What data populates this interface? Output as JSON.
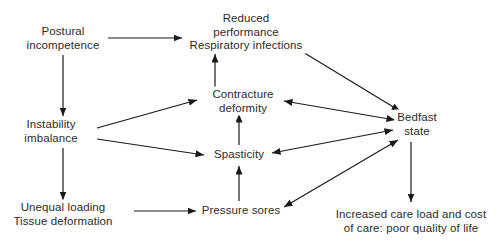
{
  "diagram": {
    "background_color": "#ffffff",
    "text_color": "#2b2b2b",
    "arrow_color": "#1a1a1a",
    "nodes": [
      {
        "id": "postural",
        "name": "postural-incompetence",
        "lines": [
          "Postural",
          "incompetence"
        ],
        "x": 63,
        "y": 38
      },
      {
        "id": "reduced",
        "name": "reduced-performance-respiratory-infections",
        "lines": [
          "Reduced",
          "performance",
          "Respiratory infections"
        ],
        "x": 246,
        "y": 32
      },
      {
        "id": "instability",
        "name": "instability-imbalance",
        "lines": [
          "Instability",
          "imbalance"
        ],
        "x": 51,
        "y": 131
      },
      {
        "id": "contracture",
        "name": "contracture-deformity",
        "lines": [
          "Contracture",
          "deformity"
        ],
        "x": 243,
        "y": 101
      },
      {
        "id": "spasticity",
        "name": "spasticity",
        "lines": [
          "Spasticity"
        ],
        "x": 239,
        "y": 155
      },
      {
        "id": "bedfast",
        "name": "bedfast-state",
        "lines": [
          "Bedfast",
          "state"
        ],
        "x": 417,
        "y": 124
      },
      {
        "id": "unequal",
        "name": "unequal-loading-tissue-deformation",
        "lines": [
          "Unequal loading",
          "Tissue deformation"
        ],
        "x": 63,
        "y": 214
      },
      {
        "id": "pressure",
        "name": "pressure-sores",
        "lines": [
          "Pressure sores"
        ],
        "x": 241,
        "y": 211
      },
      {
        "id": "increased",
        "name": "increased-care-load-quality-of-life",
        "lines": [
          "Increased care load and cost",
          "of care: poor quality of life"
        ],
        "x": 411,
        "y": 221
      }
    ],
    "edges": [
      {
        "name": "edge-postural-to-reduced",
        "from": "postural",
        "to": "reduced",
        "x1": 108,
        "y1": 38,
        "x2": 182,
        "y2": 38,
        "double": false
      },
      {
        "name": "edge-postural-to-instability",
        "from": "postural",
        "to": "instability",
        "x1": 63,
        "y1": 55,
        "x2": 63,
        "y2": 116,
        "double": false
      },
      {
        "name": "edge-instability-to-contracture",
        "from": "instability",
        "to": "contracture",
        "x1": 97,
        "y1": 128,
        "x2": 197,
        "y2": 100,
        "double": false
      },
      {
        "name": "edge-instability-to-spasticity",
        "from": "instability",
        "to": "spasticity",
        "x1": 97,
        "y1": 139,
        "x2": 204,
        "y2": 155,
        "double": false
      },
      {
        "name": "edge-instability-to-unequal",
        "from": "instability",
        "to": "unequal",
        "x1": 63,
        "y1": 148,
        "x2": 63,
        "y2": 200,
        "double": false
      },
      {
        "name": "edge-contracture-to-reduced",
        "from": "contracture",
        "to": "reduced",
        "x1": 215,
        "y1": 88,
        "x2": 215,
        "y2": 54,
        "double": false
      },
      {
        "name": "edge-spasticity-to-contracture",
        "from": "spasticity",
        "to": "contracture",
        "x1": 239,
        "y1": 145,
        "x2": 239,
        "y2": 114,
        "double": false
      },
      {
        "name": "edge-pressure-to-spasticity",
        "from": "pressure",
        "to": "spasticity",
        "x1": 239,
        "y1": 201,
        "x2": 239,
        "y2": 166,
        "double": false
      },
      {
        "name": "edge-unequal-to-pressure",
        "from": "unequal",
        "to": "pressure",
        "x1": 134,
        "y1": 211,
        "x2": 196,
        "y2": 211,
        "double": false
      },
      {
        "name": "edge-reduced-bedfast",
        "from": "reduced",
        "to": "bedfast",
        "x1": 288,
        "y1": 43,
        "x2": 400,
        "y2": 111,
        "double": true
      },
      {
        "name": "edge-contracture-bedfast",
        "from": "contracture",
        "to": "bedfast",
        "x1": 284,
        "y1": 101,
        "x2": 395,
        "y2": 120,
        "double": true
      },
      {
        "name": "edge-spasticity-bedfast",
        "from": "spasticity",
        "to": "bedfast",
        "x1": 272,
        "y1": 153,
        "x2": 393,
        "y2": 130,
        "double": true
      },
      {
        "name": "edge-pressure-bedfast",
        "from": "pressure",
        "to": "bedfast",
        "x1": 284,
        "y1": 207,
        "x2": 398,
        "y2": 140,
        "double": true
      },
      {
        "name": "edge-bedfast-to-increased",
        "from": "bedfast",
        "to": "increased",
        "x1": 411,
        "y1": 142,
        "x2": 411,
        "y2": 202,
        "double": false
      }
    ]
  }
}
